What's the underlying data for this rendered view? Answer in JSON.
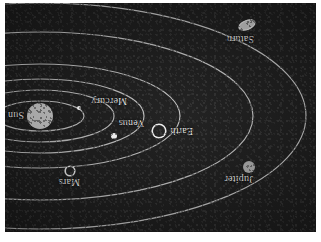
{
  "figure": {
    "orientation": "rotated-180",
    "background_color": "#181818",
    "orbit_color": "#d8d8d8",
    "label_color": "#e8e8e8",
    "plate": {
      "x": 5,
      "y": 3,
      "width": 311,
      "height": 229
    }
  },
  "chart_data": {
    "type": "diagram",
    "center_object": "Sun",
    "projection": "oblique elliptical orbits, viewer above ecliptic",
    "objects": [
      {
        "name": "Sun",
        "label": "Sun",
        "kind": "star",
        "radius_px": 13,
        "fill": "#c8c8c8",
        "cx": 276,
        "cy": 116,
        "label_dx": 16,
        "label_dy": -4
      },
      {
        "name": "Mercury",
        "label": "Mercury",
        "kind": "planet",
        "radius_px": 2,
        "fill": "#ffffff",
        "cx": 237,
        "cy": 124,
        "label_dx": -48,
        "label_dy": 2
      },
      {
        "name": "Venus",
        "label": "Venus",
        "kind": "planet",
        "radius_px": 3,
        "fill": "#ffffff",
        "cx": 202,
        "cy": 96,
        "label_dx": -30,
        "label_dy": 8
      },
      {
        "name": "Earth",
        "label": "Earth",
        "kind": "planet",
        "radius_px": 6,
        "fill": "#1a1a1a",
        "ring": "#f2f2f2",
        "cx": 157,
        "cy": 101,
        "label_dx": -34,
        "label_dy": -5
      },
      {
        "name": "Mars",
        "label": "Mars",
        "kind": "planet",
        "radius_px": 4,
        "fill": "#1a1a1a",
        "ring": "#e6e6e6",
        "cx": 246,
        "cy": 61,
        "label_dx": -10,
        "label_dy": -16
      },
      {
        "name": "Jupiter",
        "label": "Jupiter",
        "kind": "planet",
        "radius_px": 6,
        "fill": "#a8a8a8",
        "cx": 67,
        "cy": 65,
        "label_dx": -4,
        "label_dy": -17
      },
      {
        "name": "Saturn",
        "label": "Saturn",
        "kind": "planet",
        "radius_px": 5,
        "fill": "#c0c0c0",
        "cx": 68,
        "cy": 206,
        "label_dx": -6,
        "label_dy": -18,
        "has_rings": true
      }
    ],
    "orbits": [
      {
        "body": "Mercury",
        "rx": 44,
        "ry": 15
      },
      {
        "body": "Venus",
        "rx": 74,
        "ry": 26
      },
      {
        "body": "Earth",
        "rx": 104,
        "ry": 37
      },
      {
        "body": "Mars",
        "rx": 140,
        "ry": 52
      },
      {
        "body": "Jupiter",
        "rx": 213,
        "ry": 84
      },
      {
        "body": "Saturn",
        "rx": 266,
        "ry": 113
      }
    ],
    "labels": [
      "Sun",
      "Mercury",
      "Venus",
      "Earth",
      "Mars",
      "Jupiter",
      "Saturn"
    ]
  }
}
